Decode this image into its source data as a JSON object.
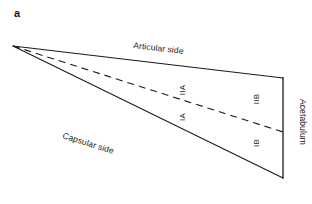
{
  "figure": {
    "panel_label": "a",
    "background_color": "#ffffff",
    "line_color": "#1a1a1a"
  },
  "diagram": {
    "type": "labeled-wedge-schematic",
    "edges": {
      "articular_side_label": "Articular side",
      "capsular_side_label": "Capsular side"
    },
    "zones": {
      "zone_iia": "IIA",
      "zone_ia": "IA",
      "zone_iib": "IIB",
      "zone_ib": "IB"
    },
    "axis": {
      "acetabulum_label": "Acetabulum"
    },
    "geometry": {
      "apex": [
        13,
        46
      ],
      "top_right": [
        283,
        78
      ],
      "bottom_right": [
        283,
        178
      ],
      "dashed_right": [
        283,
        132
      ],
      "vertical_line_x": 283
    }
  }
}
